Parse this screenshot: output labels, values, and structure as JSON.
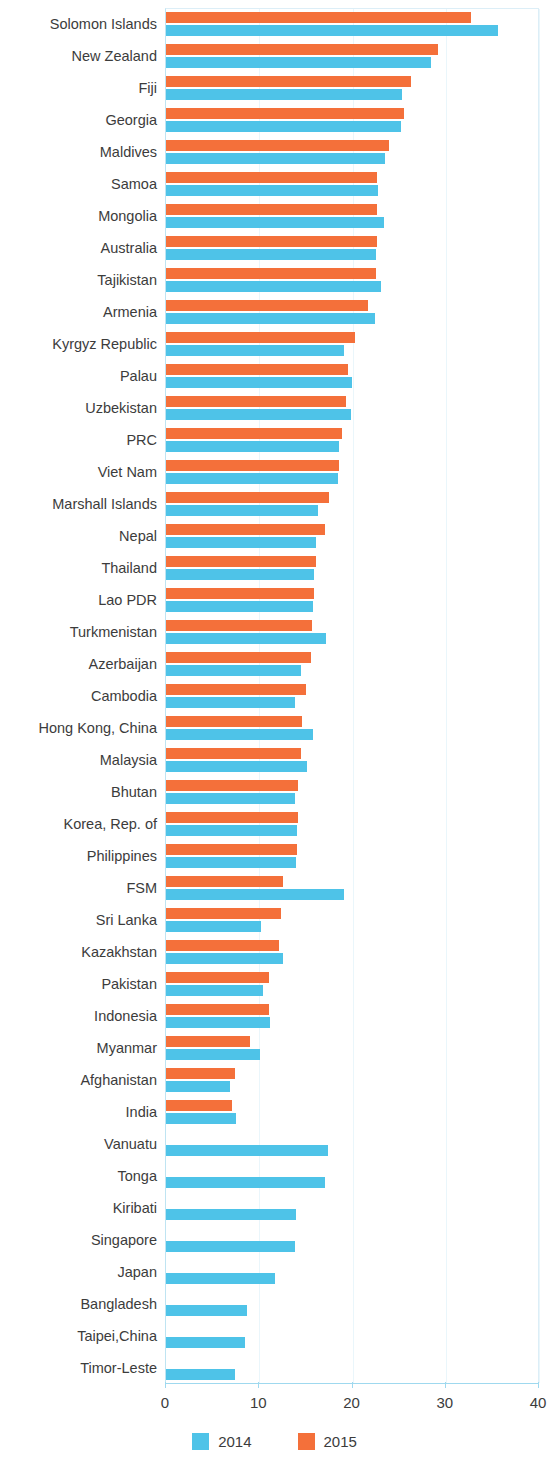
{
  "chart_data": {
    "type": "bar",
    "orientation": "horizontal",
    "title": "",
    "subtitle": "",
    "xlabel": "",
    "ylabel": "",
    "xlim": [
      0,
      40
    ],
    "xticks": [
      0,
      10,
      20,
      30,
      40
    ],
    "xtick_labels": [
      "0",
      "10",
      "20",
      "30",
      "40"
    ],
    "grid": true,
    "grid_axis": "x",
    "legend_position": "bottom-center",
    "colors": {
      "2014": "#4EC3E8",
      "2015": "#F4703A",
      "gridline": "#eaf6fb",
      "axis": "#9fd9ef",
      "text": "#3c3c3c"
    },
    "legend": [
      {
        "label": "2014",
        "color": "#4EC3E8"
      },
      {
        "label": "2015",
        "color": "#F4703A"
      }
    ],
    "categories": [
      "Solomon Islands",
      "New Zealand",
      "Fiji",
      "Georgia",
      "Maldives",
      "Samoa",
      "Mongolia",
      "Australia",
      "Tajikistan",
      "Armenia",
      "Kyrgyz Republic",
      "Palau",
      "Uzbekistan",
      "PRC",
      "Viet Nam",
      "Marshall Islands",
      "Nepal",
      "Thailand",
      "Lao PDR",
      "Turkmenistan",
      "Azerbaijan",
      "Cambodia",
      "Hong Kong, China",
      "Malaysia",
      "Bhutan",
      "Korea, Rep. of",
      "Philippines",
      "FSM",
      "Sri Lanka",
      "Kazakhstan",
      "Pakistan",
      "Indonesia",
      "Myanmar",
      "Afghanistan",
      "India",
      "Vanuatu",
      "Tonga",
      "Kiribati",
      "Singapore",
      "Japan",
      "Bangladesh",
      "Taipei,China",
      "Timor-Leste"
    ],
    "series": [
      {
        "name": "2014",
        "color": "#4EC3E8",
        "values": [
          35.6,
          28.4,
          25.3,
          25.2,
          23.5,
          22.7,
          23.4,
          22.5,
          23.1,
          22.4,
          19.1,
          19.9,
          19.8,
          18.6,
          18.4,
          16.3,
          16.1,
          15.9,
          15.8,
          17.2,
          14.5,
          13.8,
          15.8,
          15.1,
          13.8,
          14.0,
          13.9,
          19.1,
          10.2,
          12.6,
          10.4,
          11.1,
          10.1,
          6.9,
          7.5,
          17.4,
          17.0,
          13.9,
          13.8,
          11.7,
          8.7,
          8.5,
          7.4
        ]
      },
      {
        "name": "2015",
        "color": "#F4703A",
        "values": [
          32.7,
          29.2,
          26.3,
          25.5,
          23.9,
          22.6,
          22.6,
          22.6,
          22.5,
          21.7,
          20.3,
          19.5,
          19.3,
          18.9,
          18.6,
          17.5,
          17.0,
          16.1,
          15.9,
          15.7,
          15.6,
          15.0,
          14.6,
          14.5,
          14.2,
          14.2,
          14.0,
          12.5,
          12.3,
          12.1,
          11.0,
          11.0,
          9.0,
          7.4,
          7.1,
          null,
          null,
          null,
          null,
          null,
          null,
          null,
          null
        ]
      }
    ]
  }
}
